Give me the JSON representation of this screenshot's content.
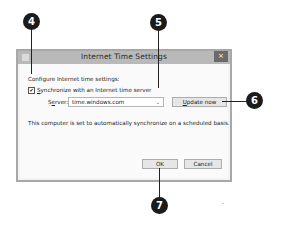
{
  "dialog": {
    "title": "Internet Time Settings",
    "close_label": "×",
    "intro": "Configure Internet time settings:",
    "sync_checkbox": {
      "label_first": "S",
      "label_rest": "ynchronize with an Internet time server",
      "checked": true,
      "glyph": "✔"
    },
    "server": {
      "label_first": "S",
      "label_mid": "e",
      "label_rest": "rver:",
      "value": "time.windows.com",
      "arrow": "⌄"
    },
    "update_button": {
      "label_first": "U",
      "label_rest": "pdate now"
    },
    "status": "This computer is set to automatically synchronize on a scheduled basis.",
    "ok_label": "OK",
    "cancel_label": "Cancel"
  },
  "callouts": [
    {
      "number": "4"
    },
    {
      "number": "5"
    },
    {
      "number": "6"
    },
    {
      "number": "7"
    }
  ],
  "colors": {
    "titlebar": "#b9b9b9",
    "close": "#6a6a6a",
    "callout": "#1b1b1b"
  }
}
